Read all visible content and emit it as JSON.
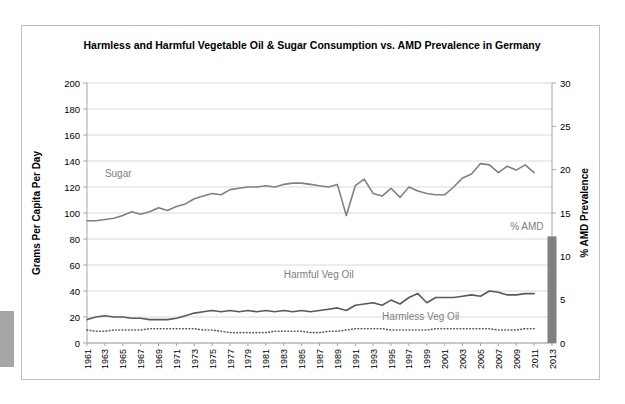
{
  "chart_data": {
    "type": "line",
    "title": "Harmless and Harmful Vegetable Oil & Sugar Consumption vs. AMD Prevalence in Germany",
    "title_line1": "Harmless and Harmful Vegetable Oil & Sugar Consumption vs. AMD Prevalence in",
    "title_line2": "Germany",
    "xlabel": "",
    "ylabel": "Grams Per Capita Per Day",
    "y2label": "% AMD Prevalence",
    "ylim": [
      0,
      200
    ],
    "y2lim": [
      0,
      30
    ],
    "ytick_step": 20,
    "y2tick_step": 5,
    "yticks": [
      "0",
      "20",
      "40",
      "60",
      "80",
      "100",
      "120",
      "140",
      "160",
      "180",
      "200"
    ],
    "y2ticks": [
      "0",
      "5",
      "10",
      "15",
      "20",
      "25",
      "30"
    ],
    "grid": true,
    "legend_position": "inline-annotations",
    "x_start": 1961,
    "x_end": 2013,
    "xtick_step": 2,
    "xticks": [
      "1961",
      "1963",
      "1965",
      "1967",
      "1969",
      "1971",
      "1973",
      "1975",
      "1977",
      "1979",
      "1981",
      "1983",
      "1985",
      "1987",
      "1989",
      "1991",
      "1993",
      "1995",
      "1997",
      "1999",
      "2001",
      "2003",
      "2005",
      "2007",
      "2009",
      "2011",
      "2013"
    ],
    "x": [
      1961,
      1962,
      1963,
      1964,
      1965,
      1966,
      1967,
      1968,
      1969,
      1970,
      1971,
      1972,
      1973,
      1974,
      1975,
      1976,
      1977,
      1978,
      1979,
      1980,
      1981,
      1982,
      1983,
      1984,
      1985,
      1986,
      1987,
      1988,
      1989,
      1990,
      1991,
      1992,
      1993,
      1994,
      1995,
      1996,
      1997,
      1998,
      1999,
      2000,
      2001,
      2002,
      2003,
      2004,
      2005,
      2006,
      2007,
      2008,
      2009,
      2010,
      2011
    ],
    "series": [
      {
        "name": "Sugar",
        "axis": "left",
        "color": "#808080",
        "style": "solid",
        "label_x": 1963,
        "label_y": 128,
        "values": [
          94,
          94,
          95,
          96,
          98,
          101,
          99,
          101,
          104,
          102,
          105,
          107,
          111,
          113,
          115,
          114,
          118,
          119,
          120,
          120,
          121,
          120,
          122,
          123,
          123,
          122,
          121,
          120,
          122,
          98,
          121,
          126,
          115,
          113,
          119,
          112,
          120,
          117,
          115,
          114,
          114,
          120,
          127,
          130,
          138,
          137,
          131,
          136,
          133,
          137,
          131
        ]
      },
      {
        "name": "Harmful Veg Oil",
        "axis": "left",
        "color": "#595959",
        "style": "solid",
        "label_x": 1983,
        "label_y": 50,
        "values": [
          18,
          20,
          21,
          20,
          20,
          19,
          19,
          18,
          18,
          18,
          19,
          21,
          23,
          24,
          25,
          24,
          25,
          24,
          25,
          24,
          25,
          24,
          25,
          24,
          25,
          24,
          25,
          26,
          27,
          25,
          29,
          30,
          31,
          29,
          33,
          30,
          35,
          38,
          31,
          35,
          35,
          35,
          36,
          37,
          36,
          40,
          39,
          37,
          37,
          38,
          38
        ]
      },
      {
        "name": "Harmless Veg Oil",
        "axis": "left",
        "color": "#595959",
        "style": "dotted",
        "label_x": 1994,
        "label_y": 18,
        "values": [
          10,
          9,
          9,
          10,
          10,
          10,
          10,
          11,
          11,
          11,
          11,
          11,
          11,
          10,
          10,
          9,
          8,
          8,
          8,
          8,
          8,
          9,
          9,
          9,
          9,
          8,
          8,
          9,
          9,
          10,
          11,
          11,
          11,
          11,
          10,
          10,
          10,
          10,
          10,
          11,
          11,
          11,
          11,
          11,
          11,
          11,
          10,
          10,
          10,
          11,
          11
        ]
      }
    ],
    "bar_series": {
      "name": "% AMD",
      "axis": "right",
      "color": "#808080",
      "label": "% AMD",
      "x": 2013,
      "value": 12.3
    }
  }
}
